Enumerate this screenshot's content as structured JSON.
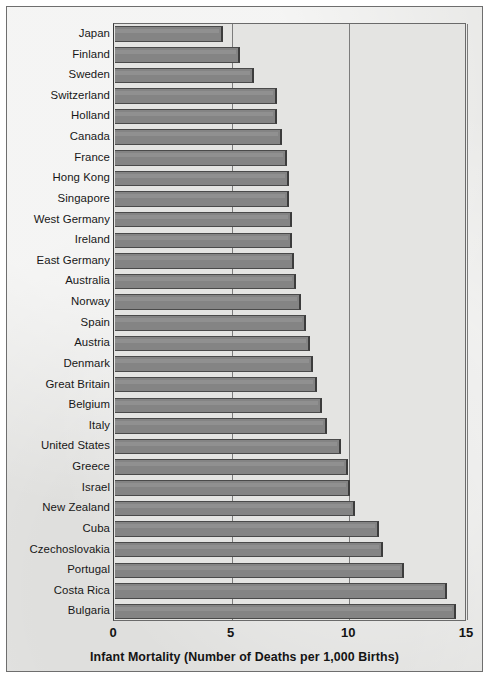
{
  "chart_data": {
    "type": "bar",
    "orientation": "horizontal",
    "title": "",
    "xlabel": "Infant Mortality (Number of Deaths per 1,000 Births)",
    "ylabel": "",
    "xlim": [
      0,
      15
    ],
    "xticks": [
      0,
      5,
      10,
      15
    ],
    "xtick_labels": [
      "0",
      "5",
      "10",
      "15"
    ],
    "grid": "vertical",
    "legend": "none",
    "bar_color": "#848484",
    "categories": [
      "Japan",
      "Finland",
      "Sweden",
      "Switzerland",
      "Holland",
      "Canada",
      "France",
      "Hong Kong",
      "Singapore",
      "West Germany",
      "Ireland",
      "East Germany",
      "Australia",
      "Norway",
      "Spain",
      "Austria",
      "Denmark",
      "Great Britain",
      "Belgium",
      "Italy",
      "United States",
      "Greece",
      "Israel",
      "New Zealand",
      "Cuba",
      "Czechoslovakia",
      "Portugal",
      "Costa Rica",
      "Bulgaria"
    ],
    "values": [
      4.6,
      5.3,
      5.9,
      6.9,
      6.9,
      7.1,
      7.3,
      7.4,
      7.4,
      7.5,
      7.5,
      7.6,
      7.7,
      7.9,
      8.1,
      8.3,
      8.4,
      8.6,
      8.8,
      9.0,
      9.6,
      9.9,
      10.0,
      10.2,
      11.2,
      11.4,
      12.3,
      14.1,
      14.5
    ]
  }
}
